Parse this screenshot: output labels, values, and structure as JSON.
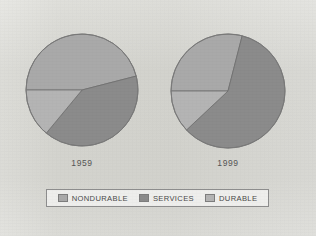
{
  "figure": {
    "background_color": "#eaeae7",
    "pies": [
      {
        "name": "pie-1959",
        "year_label": "1959",
        "cx": 82,
        "cy": 90,
        "r": 56,
        "start_angle": 180,
        "slices": [
          {
            "label": "NONDURABLE",
            "value": 46,
            "color": "#a9a9a9"
          },
          {
            "label": "SERVICES",
            "value": 40,
            "color": "#8b8b8b"
          },
          {
            "label": "DURABLE",
            "value": 14,
            "color": "#b4b4b4"
          }
        ]
      },
      {
        "name": "pie-1999",
        "year_label": "1999",
        "cx": 228,
        "cy": 91,
        "r": 57,
        "start_angle": 180,
        "slices": [
          {
            "label": "NONDURABLE",
            "value": 29,
            "color": "#a9a9a9"
          },
          {
            "label": "SERVICES",
            "value": 59,
            "color": "#8b8b8b"
          },
          {
            "label": "DURABLE",
            "value": 12,
            "color": "#b4b4b4"
          }
        ]
      }
    ]
  },
  "legend": {
    "items": [
      {
        "label": "NONDURABLE",
        "color": "#a9a9a9"
      },
      {
        "label": "SERVICES",
        "color": "#8b8b8b"
      },
      {
        "label": "DURABLE",
        "color": "#b4b4b4"
      }
    ]
  },
  "chart_data": {
    "type": "pie",
    "title": "",
    "subtitle": "",
    "xlabel": "",
    "ylabel": "",
    "grid": false,
    "legend_position": "bottom",
    "categories": [
      "NONDURABLE",
      "SERVICES",
      "DURABLE"
    ],
    "colors": [
      "#a9a9a9",
      "#8b8b8b",
      "#b4b4b4"
    ],
    "units": "percent of total",
    "charts": [
      {
        "panel_label": "1959",
        "values": [
          46,
          40,
          14
        ]
      },
      {
        "panel_label": "1999",
        "values": [
          29,
          59,
          12
        ]
      }
    ],
    "series": [
      {
        "name": "1959",
        "values": [
          46,
          40,
          14
        ]
      },
      {
        "name": "1999",
        "values": [
          29,
          59,
          12
        ]
      }
    ],
    "annotations": []
  }
}
